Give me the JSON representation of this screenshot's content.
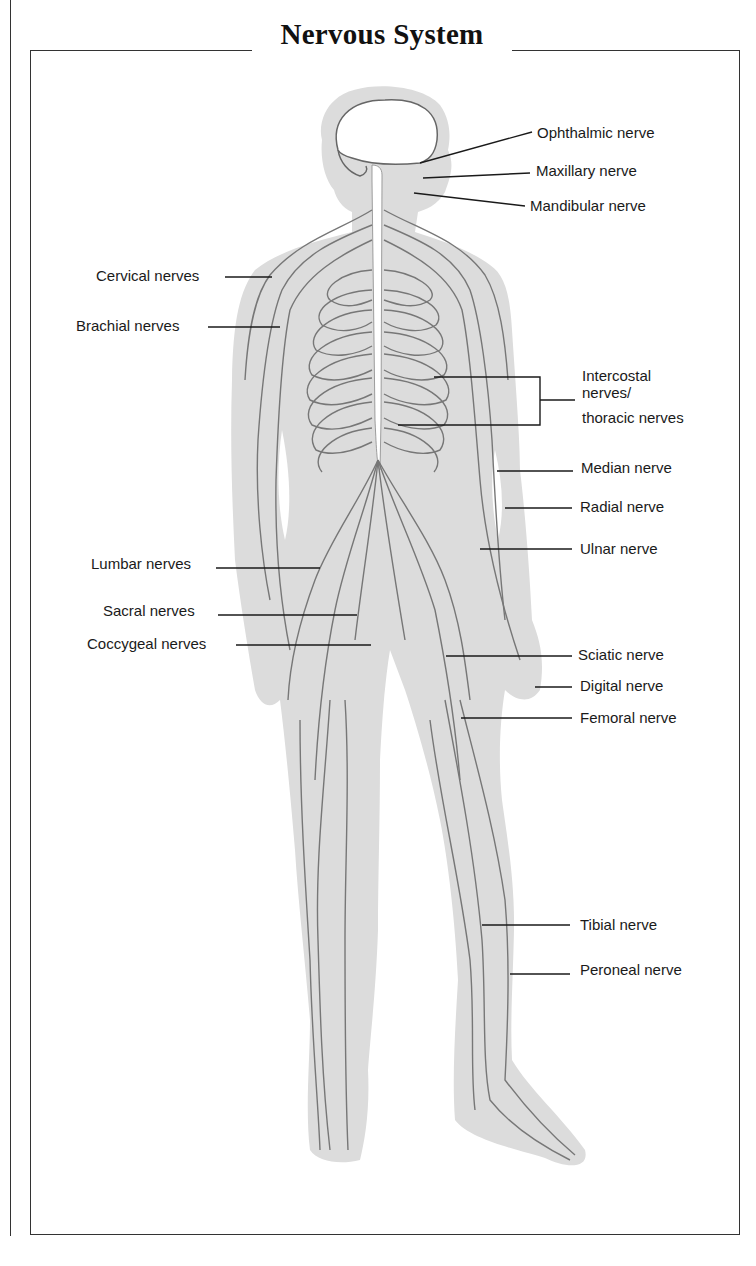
{
  "title": "Nervous System",
  "colors": {
    "body_fill": "#dcdcdc",
    "nerve": "#777777",
    "leader": "#1a1a1a",
    "frame": "#333333"
  },
  "labels_left": [
    {
      "id": "cervical",
      "text": "Cervical nerves"
    },
    {
      "id": "brachial",
      "text": "Brachial nerves"
    },
    {
      "id": "lumbar",
      "text": "Lumbar nerves"
    },
    {
      "id": "sacral",
      "text": "Sacral nerves"
    },
    {
      "id": "coccygeal",
      "text": "Coccygeal nerves"
    }
  ],
  "labels_right": [
    {
      "id": "ophthalmic",
      "text": "Ophthalmic nerve"
    },
    {
      "id": "maxillary",
      "text": "Maxillary nerve"
    },
    {
      "id": "mandibular",
      "text": "Mandibular nerve"
    },
    {
      "id": "intercostal_1",
      "text": "Intercostal"
    },
    {
      "id": "intercostal_2",
      "text": "nerves/"
    },
    {
      "id": "intercostal_3",
      "text": "thoracic nerves"
    },
    {
      "id": "median",
      "text": "Median nerve"
    },
    {
      "id": "radial",
      "text": "Radial nerve"
    },
    {
      "id": "ulnar",
      "text": "Ulnar nerve"
    },
    {
      "id": "sciatic",
      "text": "Sciatic nerve"
    },
    {
      "id": "digital",
      "text": "Digital nerve"
    },
    {
      "id": "femoral",
      "text": "Femoral nerve"
    },
    {
      "id": "tibial",
      "text": "Tibial nerve"
    },
    {
      "id": "peroneal",
      "text": "Peroneal nerve"
    }
  ]
}
